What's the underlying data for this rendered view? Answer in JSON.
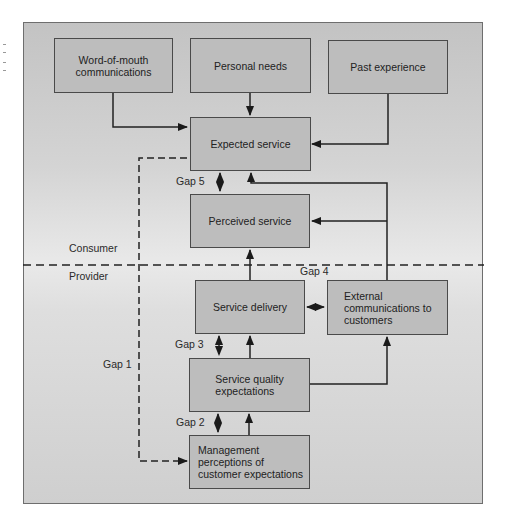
{
  "diagram": {
    "title": "",
    "nodes": {
      "word_of_mouth": "Word-of-mouth\ncommunications",
      "personal_needs": "Personal needs",
      "past_experience": "Past experience",
      "expected_service": "Expected service",
      "perceived_service": "Perceived service",
      "service_delivery": "Service delivery",
      "external_communications": "External\ncommunications to\ncustomers",
      "service_quality_expectations": "Service quality\nexpectations",
      "management_perceptions": "Management\nperceptions of\ncustomer expectations"
    },
    "regions": {
      "consumer": "Consumer",
      "provider": "Provider"
    },
    "gaps": {
      "gap1": "Gap 1",
      "gap2": "Gap 2",
      "gap3": "Gap 3",
      "gap4": "Gap 4",
      "gap5": "Gap 5"
    },
    "edges": [
      {
        "from": "word_of_mouth",
        "to": "expected_service",
        "style": "solid"
      },
      {
        "from": "personal_needs",
        "to": "expected_service",
        "style": "solid"
      },
      {
        "from": "past_experience",
        "to": "expected_service",
        "style": "solid"
      },
      {
        "from": "external_communications",
        "to": "expected_service",
        "style": "solid"
      },
      {
        "from": "external_communications",
        "to": "perceived_service",
        "style": "solid"
      },
      {
        "from": "service_delivery",
        "to": "perceived_service",
        "style": "solid"
      },
      {
        "from": "service_quality_expectations",
        "to": "service_delivery",
        "style": "solid"
      },
      {
        "from": "service_quality_expectations",
        "to": "external_communications",
        "style": "solid"
      },
      {
        "from": "management_perceptions",
        "to": "service_quality_expectations",
        "style": "solid"
      },
      {
        "from": "expected_service",
        "to": "perceived_service",
        "style": "dashed-bidirectional",
        "gap": "Gap 5"
      },
      {
        "from": "service_delivery",
        "to": "external_communications",
        "style": "dashed-bidirectional",
        "gap": "Gap 4"
      },
      {
        "from": "service_delivery",
        "to": "service_quality_expectations",
        "style": "dashed-bidirectional",
        "gap": "Gap 3"
      },
      {
        "from": "service_quality_expectations",
        "to": "management_perceptions",
        "style": "dashed-bidirectional",
        "gap": "Gap 2"
      },
      {
        "from": "expected_service",
        "to": "management_perceptions",
        "style": "dashed-bidirectional",
        "gap": "Gap 1"
      }
    ],
    "colors": {
      "box_fill": "#bdbdbd",
      "box_border": "#4a4a4a",
      "frame_fill": "#d6d6d6",
      "line": "#222222"
    }
  }
}
